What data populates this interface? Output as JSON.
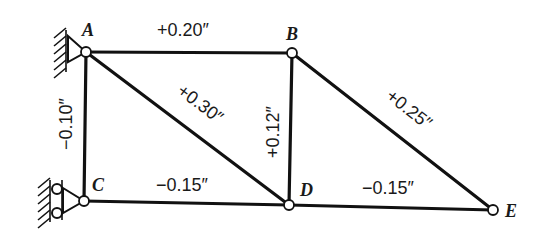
{
  "figure": {
    "type": "truss-diagram",
    "units": "inches"
  },
  "joints": [
    {
      "id": "A",
      "label": "A",
      "x": 86,
      "y": 52
    },
    {
      "id": "B",
      "label": "B",
      "x": 292,
      "y": 53
    },
    {
      "id": "C",
      "label": "C",
      "x": 84,
      "y": 201
    },
    {
      "id": "D",
      "label": "D",
      "x": 289,
      "y": 205
    },
    {
      "id": "E",
      "label": "E",
      "x": 493,
      "y": 210
    }
  ],
  "members": [
    {
      "id": "AB",
      "label": "+0.20″"
    },
    {
      "id": "AC",
      "label": "−0.10″"
    },
    {
      "id": "AD",
      "label": "+0.30″"
    },
    {
      "id": "BD",
      "label": "+0.12″"
    },
    {
      "id": "BE",
      "label": "+0.25″"
    },
    {
      "id": "CD",
      "label": "−0.15″"
    },
    {
      "id": "DE",
      "label": "−0.15″"
    }
  ],
  "supports": [
    {
      "joint": "A",
      "type": "pin"
    },
    {
      "joint": "C",
      "type": "roller"
    }
  ]
}
